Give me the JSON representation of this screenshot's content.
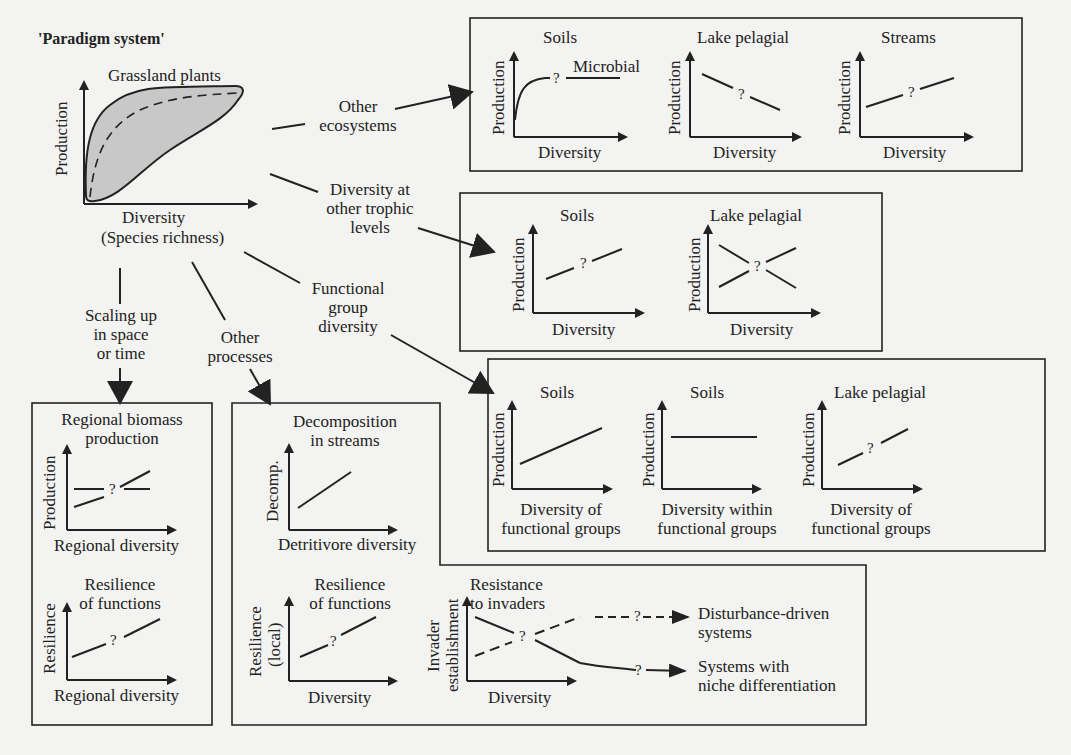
{
  "title": "'Paradigm system'",
  "paradigm": {
    "heading": "Grassland plants",
    "y_axis": "Production",
    "x_axis_line1": "Diversity",
    "x_axis_line2": "(Species richness)"
  },
  "branches": {
    "other_ecosystems": [
      "Other",
      "ecosystems"
    ],
    "trophic_levels": [
      "Diversity at",
      "other trophic",
      "levels"
    ],
    "functional_group": [
      "Functional",
      "group",
      "diversity"
    ],
    "scaling_up": [
      "Scaling up",
      "in space",
      "or time"
    ],
    "other_processes": [
      "Other",
      "processes"
    ]
  },
  "panels": {
    "other_ecosystems": [
      {
        "title": "Soils",
        "annotation": "Microbial",
        "y_axis": "Production",
        "x_axis": "Diversity",
        "mark": "?"
      },
      {
        "title": "Lake pelagial",
        "y_axis": "Production",
        "x_axis": "Diversity",
        "mark": "?"
      },
      {
        "title": "Streams",
        "y_axis": "Production",
        "x_axis": "Diversity",
        "mark": "?"
      }
    ],
    "trophic_levels": [
      {
        "title": "Soils",
        "y_axis": "Production",
        "x_axis": "Diversity",
        "mark": "?"
      },
      {
        "title": "Lake pelagial",
        "y_axis": "Production",
        "x_axis": "Diversity",
        "mark": "?"
      }
    ],
    "functional_groups": [
      {
        "title": "Soils",
        "y_axis": "Production",
        "x_axis_line1": "Diversity of",
        "x_axis_line2": "functional groups"
      },
      {
        "title": "Soils",
        "y_axis": "Production",
        "x_axis_line1": "Diversity within",
        "x_axis_line2": "functional groups"
      },
      {
        "title": "Lake pelagial",
        "y_axis": "Production",
        "x_axis_line1": "Diversity of",
        "x_axis_line2": "functional groups",
        "mark": "?"
      }
    ],
    "scaling": [
      {
        "title_line1": "Regional biomass",
        "title_line2": "production",
        "y_axis": "Production",
        "x_axis": "Regional diversity",
        "mark": "?"
      },
      {
        "title_line1": "Resilience",
        "title_line2": "of functions",
        "y_axis": "Resilience",
        "x_axis": "Regional diversity",
        "mark": "?"
      }
    ],
    "other_processes": [
      {
        "title_line1": "Decomposition",
        "title_line2": "in streams",
        "y_axis": "Decomp.",
        "x_axis": "Detritivore diversity"
      },
      {
        "title_line1": "Resilience",
        "title_line2": "of functions",
        "y_axis_line1": "Resilience",
        "y_axis_line2": "(local)",
        "x_axis": "Diversity",
        "mark": "?"
      },
      {
        "title_line1": "Resistance",
        "title_line2": "to invaders",
        "y_axis_line1": "Invader",
        "y_axis_line2": "establishment",
        "x_axis": "Diversity",
        "mark": "?"
      }
    ],
    "invader_outcomes": {
      "dashed_mark": "?",
      "solid_mark": "?",
      "dashed_target_line1": "Disturbance-driven",
      "dashed_target_line2": "systems",
      "solid_target_line1": "Systems with",
      "solid_target_line2": "niche differentiation"
    }
  },
  "colors": {
    "background": "#f3f3f1",
    "ink": "#222222",
    "fill": "#c8c8c8"
  }
}
